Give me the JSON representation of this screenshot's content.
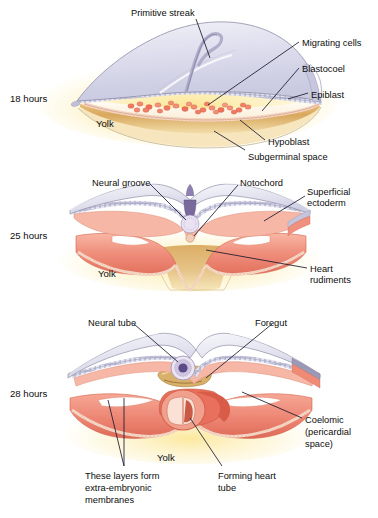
{
  "figure": {
    "background": "#ffffff"
  },
  "colors": {
    "ectoderm_sheet": "#dcdcec",
    "ectoderm_sheet_edge": "#8f8fa8",
    "epiblast_band": "#bdbdd8",
    "mesoderm_salmon": "#f0907e",
    "mesoderm_salmon_dark": "#e0705c",
    "mesoderm_light": "#f8c0b0",
    "yolk_tan": "#d8a85e",
    "yolk_glow": "#fdf0b8",
    "blastocoel_cream": "#fdf6e4",
    "migrating_cells": "#ef7a63",
    "notochord_purple": "#7a6a9c",
    "neural_tube_purple": "#5b4a86",
    "leader_line": "#1a1a2e",
    "text": "#0d0d0d"
  },
  "panels": [
    {
      "id": "panel-18h",
      "stage_label": "18 hours",
      "stage_pos": {
        "x": 10,
        "y": 93
      },
      "yolk_label": "Yolk",
      "yolk_pos": {
        "x": 96,
        "y": 118
      },
      "labels": [
        {
          "name": "primitive-streak",
          "text": "Primitive streak",
          "x": 131,
          "y": 8,
          "align": "left"
        },
        {
          "name": "migrating-cells",
          "text": "Migrating cells",
          "x": 302,
          "y": 38,
          "align": "left"
        },
        {
          "name": "blastocoel",
          "text": "Blastocoel",
          "x": 302,
          "y": 64,
          "align": "left"
        },
        {
          "name": "epiblast",
          "text": "Epiblast",
          "x": 311,
          "y": 90,
          "align": "left"
        },
        {
          "name": "hypoblast",
          "text": "Hypoblast",
          "x": 268,
          "y": 137,
          "align": "left"
        },
        {
          "name": "subgerminal-space",
          "text": "Subgerminal space",
          "x": 248,
          "y": 152,
          "align": "left"
        }
      ]
    },
    {
      "id": "panel-25h",
      "stage_label": "25 hours",
      "stage_pos": {
        "x": 10,
        "y": 230
      },
      "yolk_label": "Yolk",
      "yolk_pos": {
        "x": 98,
        "y": 268
      },
      "labels": [
        {
          "name": "neural-groove",
          "text": "Neural groove",
          "x": 92,
          "y": 178,
          "align": "left"
        },
        {
          "name": "notochord",
          "text": "Notochord",
          "x": 240,
          "y": 178,
          "align": "left"
        },
        {
          "name": "superficial-ectoderm",
          "text": "Superficial",
          "x": 307,
          "y": 187,
          "align": "left"
        },
        {
          "name": "superficial-ectoderm-2",
          "text": "ectoderm",
          "x": 307,
          "y": 198,
          "align": "left"
        },
        {
          "name": "heart-rudiments",
          "text": "Heart",
          "x": 310,
          "y": 264,
          "align": "left"
        },
        {
          "name": "heart-rudiments-2",
          "text": "rudiments",
          "x": 310,
          "y": 275,
          "align": "left"
        }
      ]
    },
    {
      "id": "panel-28h",
      "stage_label": "28 hours",
      "stage_pos": {
        "x": 10,
        "y": 388
      },
      "yolk_label": "Yolk",
      "yolk_pos": {
        "x": 157,
        "y": 452
      },
      "labels": [
        {
          "name": "neural-tube",
          "text": "Neural tube",
          "x": 88,
          "y": 318,
          "align": "left"
        },
        {
          "name": "foregut",
          "text": "Foregut",
          "x": 255,
          "y": 318,
          "align": "left"
        },
        {
          "name": "coelomic",
          "text": "Coelomic",
          "x": 305,
          "y": 415,
          "align": "left"
        },
        {
          "name": "coelomic-2",
          "text": "(pericardial",
          "x": 305,
          "y": 427,
          "align": "left"
        },
        {
          "name": "coelomic-3",
          "text": "space)",
          "x": 305,
          "y": 439,
          "align": "left"
        },
        {
          "name": "extra-embryonic-1",
          "text": "These layers form",
          "x": 85,
          "y": 471,
          "align": "left"
        },
        {
          "name": "extra-embryonic-2",
          "text": "extra-embryonic",
          "x": 85,
          "y": 483,
          "align": "left"
        },
        {
          "name": "extra-embryonic-3",
          "text": "membranes",
          "x": 85,
          "y": 495,
          "align": "left"
        },
        {
          "name": "forming-heart-tube-1",
          "text": "Forming heart",
          "x": 218,
          "y": 471,
          "align": "left"
        },
        {
          "name": "forming-heart-tube-2",
          "text": "tube",
          "x": 218,
          "y": 483,
          "align": "left"
        }
      ]
    }
  ]
}
